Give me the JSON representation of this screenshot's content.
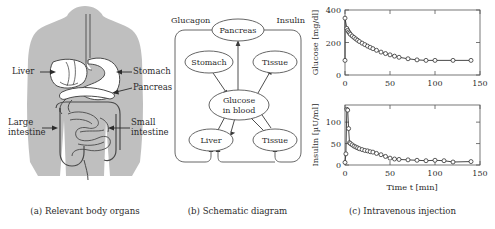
{
  "figure": {
    "panels": [
      {
        "id": "a",
        "caption": "(a) Relevant body organs"
      },
      {
        "id": "b",
        "caption": "(b) Schematic diagram"
      },
      {
        "id": "c",
        "caption": "(c) Intravenous injection"
      }
    ]
  },
  "panel_a": {
    "title": "Relevant body organs",
    "labels": [
      {
        "name": "liver",
        "text": "Liver"
      },
      {
        "name": "stomach",
        "text": "Stomach"
      },
      {
        "name": "pancreas",
        "text": "Pancreas"
      },
      {
        "name": "large-intestine",
        "line1": "Large",
        "line2": "intestine"
      },
      {
        "name": "small-intestine",
        "line1": "Small",
        "line2": "intestine"
      }
    ],
    "colors": {
      "body_silhouette": "#bfbfbf",
      "organ_fill": "#ffffff",
      "outline": "#4a4a4a"
    }
  },
  "panel_b": {
    "title": "Schematic diagram",
    "nodes": [
      {
        "name": "pancreas",
        "label": "Pancreas"
      },
      {
        "name": "stomach",
        "label": "Stomach"
      },
      {
        "name": "tissue-upper",
        "label": "Tissue"
      },
      {
        "name": "glucose-in-blood",
        "line1": "Glucose",
        "line2": "in blood"
      },
      {
        "name": "liver",
        "label": "Liver"
      },
      {
        "name": "tissue-lower",
        "label": "Tissue"
      }
    ],
    "flow_labels": [
      {
        "name": "glucagon",
        "text": "Glucagon"
      },
      {
        "name": "insulin",
        "text": "Insulin"
      }
    ],
    "colors": {
      "outline": "#555555",
      "arrow": "#3a3a3a"
    }
  },
  "panel_c": {
    "title": "Intravenous injection",
    "xlabel": "Time t [min]",
    "chart_data": [
      {
        "name": "glucose-plot",
        "type": "scatter",
        "title": "",
        "xlabel": "",
        "ylabel": "Glucose [mg/dl]",
        "xlim": [
          0,
          150
        ],
        "ylim": [
          0,
          400
        ],
        "xticks": [
          0,
          50,
          100,
          150
        ],
        "yticks": [
          0,
          200,
          400
        ],
        "grid": false,
        "legend": null,
        "marker": "open-circle",
        "series": [
          {
            "name": "Glucose concentration",
            "x": [
              0,
              0,
              2,
              3,
              4,
              5,
              6,
              8,
              10,
              12,
              14,
              16,
              19,
              22,
              25,
              28,
              31,
              35,
              40,
              45,
              50,
              55,
              60,
              70,
              80,
              90,
              100,
              120,
              140
            ],
            "y": [
              90,
              350,
              287,
              275,
              265,
              258,
              250,
              240,
              231,
              222,
              214,
              206,
              196,
              187,
              178,
              170,
              162,
              152,
              141,
              132,
              124,
              116,
              109,
              100,
              93,
              90,
              90,
              90,
              90
            ]
          }
        ]
      },
      {
        "name": "insulin-plot",
        "type": "scatter",
        "title": "",
        "xlabel": "Time t [min]",
        "ylabel": "Insulin [µU/ml]",
        "xlim": [
          0,
          150
        ],
        "ylim": [
          0,
          140
        ],
        "xticks": [
          0,
          50,
          100,
          150
        ],
        "yticks": [
          0,
          50,
          100
        ],
        "grid": false,
        "legend": null,
        "marker": "open-circle",
        "series": [
          {
            "name": "Insulin concentration",
            "x": [
              0,
              1,
              2,
              3,
              4,
              5,
              6,
              8,
              10,
              12,
              14,
              16,
              19,
              22,
              25,
              28,
              31,
              35,
              40,
              45,
              50,
              55,
              60,
              70,
              80,
              90,
              100,
              110,
              120,
              140
            ],
            "y": [
              6,
              26,
              130,
              128,
              85,
              52,
              50,
              47,
              44,
              42,
              40,
              38,
              36,
              34,
              33,
              31,
              30,
              27,
              24,
              20,
              16,
              14,
              13,
              12,
              11,
              10,
              11,
              10,
              7,
              8
            ]
          }
        ]
      }
    ]
  }
}
